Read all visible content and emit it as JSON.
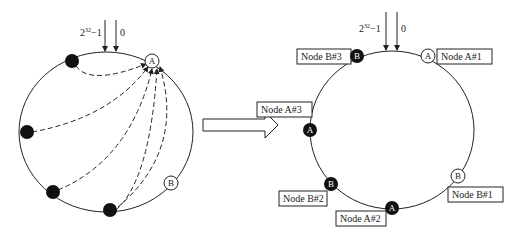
{
  "left_ring": {
    "axis_label_max": "2",
    "axis_label_max_exp": "32",
    "axis_label_max_suffix": "−1",
    "axis_label_zero": "0",
    "node_a": "A",
    "node_b": "B"
  },
  "right_ring": {
    "axis_label_max": "2",
    "axis_label_max_exp": "32",
    "axis_label_max_suffix": "−1",
    "axis_label_zero": "0",
    "nodes": [
      {
        "letter": "B",
        "label": "Node  B#3",
        "style": "filled"
      },
      {
        "letter": "A",
        "label": "Node  A#1",
        "style": "hollow"
      },
      {
        "letter": "A",
        "label": "Node  A#3",
        "style": "filled"
      },
      {
        "letter": "B",
        "label": "Node  B#2",
        "style": "filled"
      },
      {
        "letter": "A",
        "label": "Node  A#2",
        "style": "filled"
      },
      {
        "letter": "B",
        "label": "Node  B#1",
        "style": "hollow"
      }
    ]
  },
  "transition_arrow": "right-arrow",
  "colors": {
    "stroke": "#222222",
    "fill_dark": "#111111",
    "background": "#ffffff"
  }
}
